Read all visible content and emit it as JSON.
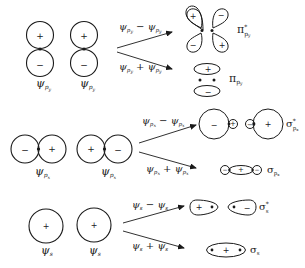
{
  "diagram": {
    "colors": {
      "line": "#1a1a1a",
      "background": "#ffffff"
    },
    "rows": [
      {
        "id": "py",
        "atomic_orbitals": [
          {
            "label_main": "ψ",
            "label_sub": "p",
            "label_subsub": "y",
            "lobes": {
              "top": "+",
              "bottom": "−"
            }
          },
          {
            "label_main": "ψ",
            "label_sub": "p",
            "label_subsub": "y",
            "lobes": {
              "top": "+",
              "bottom": "−"
            }
          }
        ],
        "antibonding": {
          "combination_a": "ψ",
          "combination_a_sub": "py",
          "combination_op": "−",
          "combination_b": "ψ",
          "combination_b_sub": "py",
          "mo_label": "π",
          "mo_star": "*",
          "mo_sub": "py",
          "lobes": {
            "top_left": "+",
            "top_right": "−",
            "bottom_left": "−",
            "bottom_right": "+"
          }
        },
        "bonding": {
          "combination_a": "ψ",
          "combination_a_sub": "py",
          "combination_op": "+",
          "combination_b": "ψ",
          "combination_b_sub": "py",
          "mo_label": "π",
          "mo_sub": "py",
          "lobes": {
            "top": "+",
            "bottom": "−"
          }
        }
      },
      {
        "id": "px",
        "atomic_orbitals": [
          {
            "label_main": "ψ",
            "label_sub": "p",
            "label_subsub": "x",
            "lobes": {
              "left": "−",
              "right": "+"
            }
          },
          {
            "label_main": "ψ",
            "label_sub": "p",
            "label_subsub": "x",
            "lobes": {
              "left": "+",
              "right": "−"
            }
          }
        ],
        "antibonding": {
          "combination_a": "ψ",
          "combination_a_sub": "px",
          "combination_op": "−",
          "combination_b": "ψ",
          "combination_b_sub": "px",
          "mo_label": "σ",
          "mo_star": "*",
          "mo_sub": "px",
          "lobes": {
            "big_left": "−",
            "small_left": "+",
            "small_right": "−",
            "big_right": "+"
          }
        },
        "bonding": {
          "combination_a": "ψ",
          "combination_a_sub": "px",
          "combination_op": "+",
          "combination_b": "ψ",
          "combination_b_sub": "px",
          "mo_label": "σ",
          "mo_sub": "px",
          "lobes": {
            "left": "−",
            "center": "+",
            "right": "−"
          }
        }
      },
      {
        "id": "s",
        "atomic_orbitals": [
          {
            "label_main": "ψ",
            "label_sub": "s",
            "lobes": {
              "center": "+"
            }
          },
          {
            "label_main": "ψ",
            "label_sub": "s",
            "lobes": {
              "center": "+"
            }
          }
        ],
        "antibonding": {
          "combination_a": "ψ",
          "combination_a_sub": "s",
          "combination_op": "−",
          "combination_b": "ψ",
          "combination_b_sub": "s",
          "mo_label": "σ",
          "mo_star": "*",
          "mo_sub": "s",
          "lobes": {
            "left": "+",
            "right": "−"
          }
        },
        "bonding": {
          "combination_a": "ψ",
          "combination_a_sub": "s",
          "combination_op": "+",
          "combination_b": "ψ",
          "combination_b_sub": "s",
          "mo_label": "σ",
          "mo_sub": "s",
          "lobes": {
            "center": "+"
          }
        }
      }
    ]
  }
}
